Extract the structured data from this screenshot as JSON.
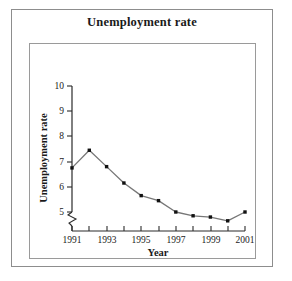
{
  "figure": {
    "title": "Unemployment rate",
    "background_color": "#ffffff",
    "frame_color": "#8d8d8d",
    "plot_frame_color": "#9a9a9a"
  },
  "chart_data": {
    "type": "line",
    "title": "Unemployment rate",
    "xlabel": "Year",
    "ylabel": "Unemployment rate",
    "x": [
      1991,
      1992,
      1993,
      1994,
      1995,
      1996,
      1997,
      1998,
      1999,
      2000,
      2001
    ],
    "values": [
      6.75,
      7.45,
      6.8,
      6.15,
      5.65,
      5.45,
      5.0,
      4.85,
      4.8,
      4.65,
      5.0
    ],
    "xlim": [
      1991,
      2001
    ],
    "ylim": [
      4.5,
      10
    ],
    "y_ticks": [
      5,
      6,
      7,
      8,
      9,
      10
    ],
    "y_tick_labels": [
      "5",
      "6",
      "7",
      "8",
      "9",
      "10"
    ],
    "x_ticks": [
      1991,
      1992,
      1993,
      1994,
      1995,
      1996,
      1997,
      1998,
      1999,
      2000,
      2001
    ],
    "x_tick_labels": [
      "1991",
      "",
      "1993",
      "",
      "1995",
      "",
      "1997",
      "",
      "1999",
      "",
      "2001"
    ],
    "x_labeled_ticks": [
      "1991",
      "1993",
      "1995",
      "1997",
      "1999",
      "2001"
    ],
    "grid": false,
    "legend": false,
    "axis_break": {
      "axis": "y",
      "below_value": 5,
      "style": "zigzag"
    },
    "line_color": "#777777",
    "marker_color": "#111111",
    "marker_style": "square"
  },
  "axis_labels": {
    "x_axis_title": "Year",
    "y_axis_title": "Unemployment rate"
  }
}
